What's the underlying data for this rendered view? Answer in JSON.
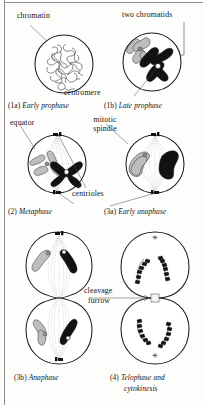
{
  "figure": {
    "panel_count": 6
  },
  "annotations": {
    "chromatin": "chromatin",
    "two_chromatids": "two chromatids",
    "centromere": "centromere",
    "equator": "equator",
    "mitotic_spindle_line1": "mitotic",
    "mitotic_spindle_line2": "spindle",
    "centrioles": "centrioles",
    "cleavage_line1": "cleavage",
    "cleavage_line2": "furrow"
  },
  "panels": [
    {
      "id": "1a",
      "number": "(1a)",
      "name": "Early prophase",
      "caption": "(1a) Early prophase"
    },
    {
      "id": "1b",
      "number": "(1b)",
      "name": "Late prophase",
      "caption": "(1b) Late prophase"
    },
    {
      "id": "2",
      "number": "(2)",
      "name": "Metaphase",
      "caption": "(2) Metaphase"
    },
    {
      "id": "3a",
      "number": "(3a)",
      "name": "Early anaphase",
      "caption": "(3a) Early anaphase"
    },
    {
      "id": "3b",
      "number": "(3b)",
      "name": "Anaphase",
      "caption": "(3b) Anaphase"
    },
    {
      "id": "4",
      "number": "(4)",
      "name_line1": "Telophase and",
      "name_line2": "cytokinesis",
      "caption": "(4) Telophase and cytokinesis"
    }
  ],
  "colors": {
    "page_background": "#fdfdfb",
    "ink": "#1c1c1c",
    "chromosome_dark": "#121212",
    "chromosome_light": "#bdbdbd",
    "spindle_gray": "#9a9a9a",
    "rule_gray": "#8d8d8d"
  }
}
